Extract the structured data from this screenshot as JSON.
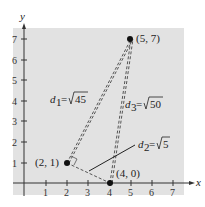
{
  "figure": {
    "axes": {
      "x_label": "x",
      "y_label": "y",
      "x_ticks": [
        "1",
        "2",
        "3",
        "4",
        "5",
        "6",
        "7"
      ],
      "y_ticks": [
        "1",
        "2",
        "3",
        "4",
        "5",
        "6",
        "7"
      ],
      "background": "#e2e2e2"
    },
    "points": [
      {
        "label": "(2, 1)",
        "x": 2,
        "y": 1
      },
      {
        "label": "(4, 0)",
        "x": 4,
        "y": 0
      },
      {
        "label": "(5, 7)",
        "x": 5,
        "y": 7
      }
    ],
    "distances": {
      "d1": {
        "name": "d",
        "sub": "1",
        "eq": "=",
        "value": "45"
      },
      "d2": {
        "name": "d",
        "sub": "2",
        "eq": "=",
        "value": "5"
      },
      "d3": {
        "name": "d",
        "sub": "3",
        "eq": "=",
        "value": "50"
      }
    }
  }
}
